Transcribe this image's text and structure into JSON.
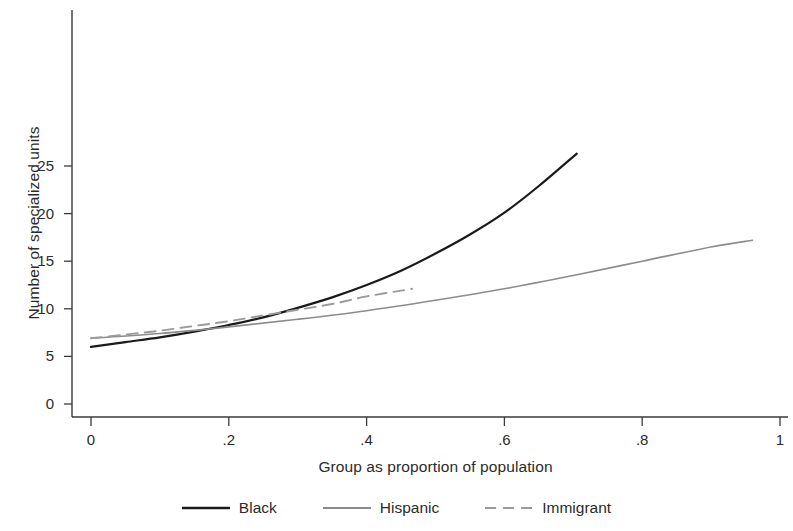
{
  "chart_data": {
    "type": "line",
    "title": "",
    "xlabel": "Group as proportion of population",
    "ylabel": "Number of specialized units",
    "xlim": [
      0,
      1
    ],
    "ylim": [
      0,
      29
    ],
    "grid": false,
    "legend_position": "bottom",
    "xticks": [
      0,
      0.2,
      0.4,
      0.6,
      0.8,
      1
    ],
    "xtick_labels": [
      "0",
      ".2",
      ".4",
      ".6",
      ".8",
      "1"
    ],
    "yticks": [
      0,
      5,
      10,
      15,
      20,
      25
    ],
    "ytick_labels": [
      "0",
      "5",
      "10",
      "15",
      "20",
      "25"
    ],
    "series": [
      {
        "name": "Black",
        "style": "solid",
        "color": "#1a1a1a",
        "width": 2.2,
        "x": [
          0,
          0.05,
          0.1,
          0.15,
          0.2,
          0.25,
          0.3,
          0.35,
          0.4,
          0.45,
          0.5,
          0.55,
          0.6,
          0.65,
          0.705
        ],
        "y": [
          6.0,
          6.5,
          7.0,
          7.6,
          8.3,
          9.1,
          10.1,
          11.2,
          12.5,
          14.0,
          15.8,
          17.8,
          20.1,
          22.9,
          26.3
        ]
      },
      {
        "name": "Hispanic",
        "style": "solid",
        "color": "#8c8c8c",
        "width": 1.6,
        "x": [
          0,
          0.1,
          0.2,
          0.3,
          0.4,
          0.5,
          0.6,
          0.7,
          0.8,
          0.9,
          0.96
        ],
        "y": [
          6.9,
          7.4,
          8.1,
          8.9,
          9.8,
          10.9,
          12.1,
          13.5,
          15.0,
          16.5,
          17.2
        ]
      },
      {
        "name": "Immigrant",
        "style": "dashed",
        "color": "#9a9a9a",
        "width": 1.9,
        "x": [
          0,
          0.05,
          0.1,
          0.15,
          0.2,
          0.25,
          0.3,
          0.35,
          0.4,
          0.466
        ],
        "y": [
          6.9,
          7.3,
          7.7,
          8.2,
          8.7,
          9.3,
          9.9,
          10.5,
          11.3,
          12.1
        ]
      }
    ]
  },
  "axes": {
    "x_label": "Group as proportion of population",
    "y_label": "Number of specialized units"
  },
  "legend": {
    "items": [
      {
        "label": "Black",
        "style": "solid",
        "color": "#1a1a1a"
      },
      {
        "label": "Hispanic",
        "style": "solid",
        "color": "#8c8c8c"
      },
      {
        "label": "Immigrant",
        "style": "dashed",
        "color": "#9a9a9a"
      }
    ]
  }
}
